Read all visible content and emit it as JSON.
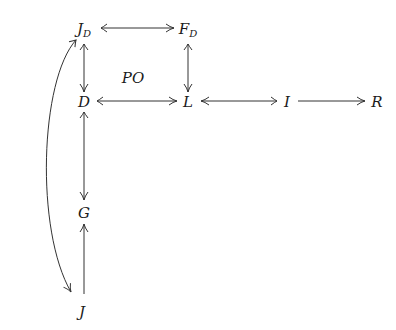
{
  "diagram": {
    "type": "commutative-diagram",
    "nodes": [
      {
        "id": "JD",
        "label": "J",
        "subscript": "D",
        "x": 84,
        "y": 33
      },
      {
        "id": "FD",
        "label": "F",
        "subscript": "D",
        "x": 188,
        "y": 33
      },
      {
        "id": "PO",
        "label": "PO",
        "subscript": "",
        "x": 133,
        "y": 78
      },
      {
        "id": "D",
        "label": "D",
        "subscript": "",
        "x": 84,
        "y": 103
      },
      {
        "id": "L",
        "label": "L",
        "subscript": "",
        "x": 188,
        "y": 103
      },
      {
        "id": "I",
        "label": "I",
        "subscript": "",
        "x": 284,
        "y": 103
      },
      {
        "id": "R",
        "label": "R",
        "subscript": "",
        "x": 377,
        "y": 103
      },
      {
        "id": "G",
        "label": "G",
        "subscript": "",
        "x": 84,
        "y": 213
      },
      {
        "id": "J",
        "label": "J",
        "subscript": "",
        "x": 84,
        "y": 318
      }
    ],
    "edges": [
      {
        "from": "JD",
        "to": "FD",
        "style": "mono"
      },
      {
        "from": "JD",
        "to": "D",
        "style": "mono"
      },
      {
        "from": "FD",
        "to": "L",
        "style": "mono"
      },
      {
        "from": "D",
        "to": "L",
        "style": "mono"
      },
      {
        "from": "I",
        "to": "L",
        "style": "mono"
      },
      {
        "from": "I",
        "to": "R",
        "style": "plain"
      },
      {
        "from": "D",
        "to": "G",
        "style": "mono"
      },
      {
        "from": "J",
        "to": "G",
        "style": "plain"
      },
      {
        "from": "JD",
        "to": "J",
        "style": "mono-curved"
      }
    ],
    "annotation": "PO",
    "colors": {
      "stroke": "#333333",
      "text": "#1a1a1a",
      "background": "#ffffff"
    }
  }
}
